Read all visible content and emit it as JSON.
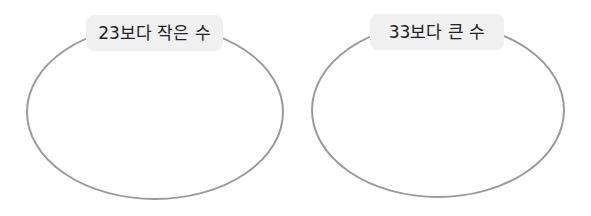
{
  "diagram": {
    "type": "sorting-circles",
    "stroke_color": "#9a9a9a",
    "label_background": "#f0f0f0",
    "groups": [
      {
        "label": "23보다 작은 수",
        "items": []
      },
      {
        "label": "33보다 큰 수",
        "items": []
      }
    ]
  }
}
